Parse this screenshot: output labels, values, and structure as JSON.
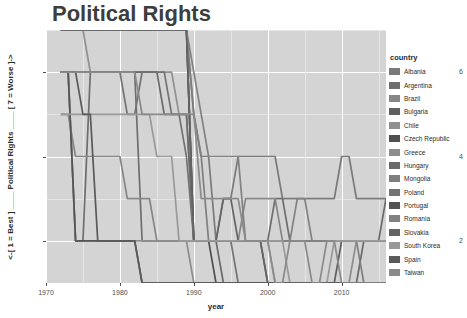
{
  "chart_data": {
    "type": "line",
    "title": "Political Rights",
    "xlabel": "year",
    "ylabel": "<-[ 1 = Best ] ____ Political Rights ____ [ 7 = Worse ]->",
    "legend_title": "country",
    "legend_position": "right",
    "grid": true,
    "xlim": [
      1970,
      2016
    ],
    "ylim": [
      1,
      7
    ],
    "xticks": [
      "1970",
      "1980",
      "1990",
      "2000",
      "2010"
    ],
    "xtick_values": [
      1970,
      1980,
      1990,
      2000,
      2010
    ],
    "yticks": [
      "2",
      "4",
      "6"
    ],
    "ytick_values": [
      2,
      4,
      6
    ],
    "x": [
      1972,
      1973,
      1974,
      1975,
      1976,
      1977,
      1978,
      1979,
      1980,
      1981,
      1982,
      1983,
      1984,
      1985,
      1986,
      1987,
      1988,
      1989,
      1990,
      1991,
      1992,
      1993,
      1994,
      1995,
      1996,
      1997,
      1998,
      1999,
      2000,
      2001,
      2002,
      2003,
      2004,
      2005,
      2006,
      2007,
      2008,
      2009,
      2010,
      2011,
      2012,
      2013,
      2014,
      2015,
      2016
    ],
    "series": [
      {
        "name": "Albania",
        "color": "#7a7a7a",
        "values": [
          7,
          7,
          7,
          7,
          7,
          7,
          7,
          7,
          7,
          7,
          7,
          7,
          7,
          7,
          7,
          7,
          7,
          7,
          5,
          4,
          4,
          2,
          3,
          3,
          4,
          4,
          4,
          4,
          4,
          4,
          3,
          3,
          3,
          3,
          3,
          3,
          3,
          3,
          4,
          4,
          3,
          3,
          3,
          3,
          3
        ]
      },
      {
        "name": "Argentina",
        "color": "#6e6e6e",
        "values": [
          6,
          6,
          2,
          2,
          6,
          6,
          6,
          6,
          6,
          6,
          6,
          2,
          2,
          2,
          2,
          2,
          2,
          2,
          2,
          2,
          2,
          2,
          2,
          2,
          2,
          2,
          2,
          2,
          2,
          3,
          3,
          2,
          2,
          2,
          2,
          2,
          2,
          2,
          2,
          2,
          2,
          2,
          2,
          2,
          2
        ]
      },
      {
        "name": "Brazil",
        "color": "#868686",
        "values": [
          5,
          5,
          4,
          4,
          4,
          4,
          4,
          4,
          4,
          3,
          3,
          3,
          3,
          2,
          2,
          2,
          2,
          2,
          2,
          2,
          2,
          2,
          2,
          2,
          2,
          3,
          3,
          3,
          3,
          3,
          2,
          2,
          2,
          2,
          2,
          2,
          2,
          2,
          2,
          2,
          2,
          2,
          2,
          2,
          2
        ]
      },
      {
        "name": "Bulgaria",
        "color": "#5f5f5f",
        "values": [
          7,
          7,
          7,
          7,
          7,
          7,
          7,
          7,
          7,
          7,
          7,
          7,
          7,
          7,
          7,
          7,
          7,
          7,
          2,
          2,
          2,
          2,
          2,
          2,
          2,
          2,
          2,
          2,
          1,
          1,
          1,
          1,
          1,
          1,
          1,
          1,
          1,
          1,
          2,
          2,
          2,
          2,
          2,
          2,
          2
        ]
      },
      {
        "name": "Chile",
        "color": "#909090",
        "values": [
          7,
          7,
          7,
          7,
          6,
          6,
          6,
          6,
          6,
          6,
          6,
          6,
          6,
          6,
          6,
          6,
          5,
          5,
          2,
          2,
          2,
          2,
          2,
          2,
          2,
          2,
          2,
          2,
          2,
          1,
          1,
          1,
          1,
          1,
          1,
          1,
          1,
          1,
          1,
          1,
          1,
          1,
          1,
          1,
          1
        ]
      },
      {
        "name": "Czech Republic",
        "color": "#4f4f4f",
        "values": [
          7,
          7,
          7,
          7,
          7,
          7,
          7,
          7,
          7,
          7,
          7,
          7,
          7,
          7,
          7,
          7,
          7,
          7,
          2,
          2,
          2,
          1,
          1,
          1,
          1,
          1,
          1,
          1,
          1,
          1,
          1,
          1,
          1,
          1,
          1,
          1,
          1,
          1,
          1,
          1,
          1,
          1,
          1,
          1,
          1
        ]
      },
      {
        "name": "Greece",
        "color": "#8d8d8d",
        "values": [
          6,
          6,
          2,
          2,
          2,
          2,
          2,
          2,
          2,
          2,
          2,
          2,
          2,
          2,
          2,
          2,
          2,
          2,
          1,
          1,
          1,
          1,
          1,
          1,
          1,
          1,
          1,
          1,
          1,
          1,
          1,
          1,
          1,
          1,
          1,
          1,
          1,
          1,
          1,
          1,
          2,
          2,
          2,
          2,
          2
        ]
      },
      {
        "name": "Hungary",
        "color": "#6a6a6a",
        "values": [
          6,
          6,
          6,
          6,
          6,
          6,
          6,
          6,
          6,
          6,
          6,
          6,
          6,
          6,
          5,
          5,
          5,
          5,
          2,
          2,
          2,
          2,
          1,
          1,
          1,
          1,
          1,
          1,
          1,
          1,
          1,
          1,
          1,
          1,
          1,
          1,
          1,
          1,
          1,
          1,
          1,
          2,
          2,
          2,
          3
        ]
      },
      {
        "name": "Mongolia",
        "color": "#7f7f7f",
        "values": [
          7,
          7,
          7,
          7,
          7,
          7,
          7,
          7,
          7,
          7,
          7,
          7,
          7,
          7,
          7,
          7,
          7,
          7,
          5,
          4,
          2,
          2,
          2,
          2,
          2,
          2,
          2,
          2,
          2,
          2,
          2,
          2,
          2,
          2,
          2,
          2,
          2,
          2,
          2,
          2,
          2,
          1,
          1,
          1,
          1
        ]
      },
      {
        "name": "Poland",
        "color": "#737373",
        "values": [
          6,
          6,
          6,
          6,
          6,
          6,
          6,
          6,
          6,
          5,
          5,
          6,
          6,
          6,
          6,
          5,
          5,
          4,
          2,
          2,
          2,
          2,
          2,
          2,
          1,
          1,
          1,
          1,
          1,
          1,
          1,
          1,
          1,
          1,
          1,
          1,
          1,
          1,
          1,
          1,
          1,
          1,
          1,
          1,
          1
        ]
      },
      {
        "name": "Portugal",
        "color": "#555555",
        "values": [
          6,
          6,
          2,
          2,
          2,
          2,
          2,
          2,
          2,
          2,
          2,
          1,
          1,
          1,
          1,
          1,
          1,
          1,
          1,
          1,
          1,
          1,
          1,
          1,
          1,
          1,
          1,
          1,
          1,
          1,
          1,
          1,
          1,
          1,
          1,
          1,
          1,
          1,
          1,
          1,
          1,
          1,
          1,
          1,
          1
        ]
      },
      {
        "name": "Romania",
        "color": "#828282",
        "values": [
          7,
          7,
          7,
          7,
          7,
          7,
          7,
          7,
          7,
          7,
          7,
          7,
          7,
          7,
          7,
          7,
          7,
          7,
          6,
          5,
          4,
          4,
          4,
          4,
          4,
          2,
          2,
          2,
          2,
          2,
          2,
          2,
          3,
          3,
          2,
          2,
          2,
          2,
          2,
          2,
          2,
          2,
          2,
          2,
          2
        ]
      },
      {
        "name": "Slovakia",
        "color": "#646464",
        "values": [
          7,
          7,
          7,
          7,
          7,
          7,
          7,
          7,
          7,
          7,
          7,
          7,
          7,
          7,
          7,
          7,
          7,
          7,
          2,
          2,
          2,
          2,
          3,
          3,
          2,
          2,
          2,
          2,
          1,
          1,
          1,
          1,
          1,
          1,
          1,
          1,
          1,
          1,
          1,
          1,
          1,
          1,
          1,
          1,
          1
        ]
      },
      {
        "name": "South Korea",
        "color": "#9a9a9a",
        "values": [
          5,
          5,
          5,
          5,
          5,
          5,
          5,
          5,
          5,
          5,
          5,
          5,
          5,
          4,
          4,
          4,
          2,
          2,
          2,
          2,
          2,
          2,
          2,
          2,
          2,
          2,
          2,
          2,
          2,
          2,
          2,
          1,
          1,
          1,
          1,
          1,
          1,
          2,
          2,
          2,
          2,
          2,
          2,
          2,
          2
        ]
      },
      {
        "name": "Spain",
        "color": "#5a5a5a",
        "values": [
          6,
          6,
          6,
          5,
          5,
          2,
          2,
          2,
          2,
          2,
          2,
          1,
          1,
          1,
          1,
          1,
          1,
          1,
          1,
          1,
          1,
          1,
          1,
          1,
          1,
          1,
          1,
          1,
          1,
          1,
          1,
          1,
          1,
          1,
          1,
          1,
          1,
          1,
          1,
          1,
          1,
          1,
          1,
          1,
          1
        ]
      },
      {
        "name": "Taiwan",
        "color": "#8a8a8a",
        "values": [
          6,
          6,
          6,
          6,
          6,
          6,
          6,
          6,
          6,
          6,
          6,
          5,
          5,
          5,
          5,
          5,
          5,
          5,
          5,
          3,
          3,
          3,
          3,
          3,
          3,
          2,
          2,
          2,
          2,
          1,
          1,
          2,
          2,
          2,
          1,
          1,
          2,
          2,
          1,
          1,
          1,
          1,
          1,
          1,
          1
        ]
      }
    ]
  },
  "legend": {
    "title": "country",
    "items": [
      {
        "label": "Albania",
        "color": "#7a7a7a"
      },
      {
        "label": "Argentina",
        "color": "#6e6e6e"
      },
      {
        "label": "Brazil",
        "color": "#868686"
      },
      {
        "label": "Bulgaria",
        "color": "#5f5f5f"
      },
      {
        "label": "Chile",
        "color": "#909090"
      },
      {
        "label": "Czech Republic",
        "color": "#4f4f4f"
      },
      {
        "label": "Greece",
        "color": "#8d8d8d"
      },
      {
        "label": "Hungary",
        "color": "#6a6a6a"
      },
      {
        "label": "Mongolia",
        "color": "#7f7f7f"
      },
      {
        "label": "Poland",
        "color": "#737373"
      },
      {
        "label": "Portugal",
        "color": "#555555"
      },
      {
        "label": "Romania",
        "color": "#828282"
      },
      {
        "label": "Slovakia",
        "color": "#646464"
      },
      {
        "label": "South Korea",
        "color": "#9a9a9a"
      },
      {
        "label": "Spain",
        "color": "#5a5a5a"
      },
      {
        "label": "Taiwan",
        "color": "#8a8a8a"
      }
    ]
  },
  "style": {
    "panel_background": "#d4d4d4",
    "grid_major": "#ffffff",
    "grid_minor": "#e6e6e6",
    "title_color": "#3d3d3d",
    "tick_color": "#4d4d4d"
  }
}
